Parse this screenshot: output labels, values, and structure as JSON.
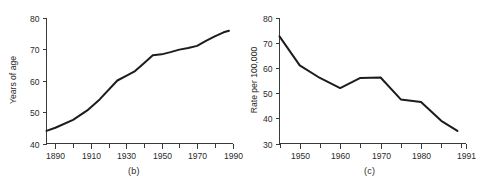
{
  "figure": {
    "panels": [
      {
        "caption": "(b)",
        "ylabel": "Years of age",
        "y_ticks": [
          "40",
          "50",
          "60",
          "70",
          "80"
        ],
        "x_ticks": [
          "1890",
          "1910",
          "1930",
          "1950",
          "1970",
          "1990"
        ]
      },
      {
        "caption": "(c)",
        "ylabel": "Rate per 100,000",
        "y_ticks": [
          "30",
          "40",
          "50",
          "60",
          "70",
          "80"
        ],
        "x_ticks": [
          "1950",
          "1960",
          "1970",
          "1980",
          "1991"
        ]
      }
    ]
  },
  "chart_data": [
    {
      "type": "line",
      "title": "(b)",
      "xlabel": "",
      "ylabel": "Years of age",
      "xlim": [
        1885,
        1990
      ],
      "ylim": [
        40,
        80
      ],
      "xticks": [
        1890,
        1910,
        1930,
        1950,
        1970,
        1990
      ],
      "xticklabels": [
        "1890",
        "1910",
        "1930",
        "1950",
        "1970",
        "1990"
      ],
      "yticks": [
        40,
        50,
        60,
        70,
        80
      ],
      "yticklabels": [
        "40",
        "50",
        "60",
        "70",
        "80"
      ],
      "minor_xtick_interval": 10,
      "grid": false,
      "legend": null,
      "x": [
        1885,
        1890,
        1900,
        1908,
        1915,
        1925,
        1930,
        1935,
        1940,
        1945,
        1950,
        1955,
        1960,
        1965,
        1970,
        1975,
        1980,
        1985,
        1988
      ],
      "values": [
        44.0,
        45.0,
        47.5,
        50.5,
        54.0,
        60.0,
        61.5,
        63.0,
        65.5,
        68.0,
        68.3,
        69.0,
        69.8,
        70.3,
        71.0,
        72.6,
        74.0,
        75.3,
        75.8
      ],
      "series": [
        {
          "name": "Life expectancy",
          "values": [
            44.0,
            45.0,
            47.5,
            50.5,
            54.0,
            60.0,
            61.5,
            63.0,
            65.5,
            68.0,
            68.3,
            69.0,
            69.8,
            70.3,
            71.0,
            72.6,
            74.0,
            75.3,
            75.8
          ]
        }
      ]
    },
    {
      "type": "line",
      "title": "(c)",
      "xlabel": "",
      "ylabel": "Rate per 100,000",
      "xlim": [
        1945,
        1991
      ],
      "ylim": [
        30,
        80
      ],
      "xticks": [
        1950,
        1960,
        1970,
        1980,
        1991
      ],
      "xticklabels": [
        "1950",
        "1960",
        "1970",
        "1980",
        "1991"
      ],
      "yticks": [
        30,
        40,
        50,
        60,
        70,
        80
      ],
      "yticklabels": [
        "30",
        "40",
        "50",
        "60",
        "70",
        "80"
      ],
      "minor_xtick_interval": 5,
      "grid": false,
      "legend": null,
      "x": [
        1945,
        1950,
        1955,
        1960,
        1965,
        1970,
        1975,
        1980,
        1985,
        1989
      ],
      "values": [
        72.5,
        61.0,
        56.0,
        52.0,
        56.0,
        56.2,
        47.5,
        46.5,
        39.0,
        35.0
      ],
      "series": [
        {
          "name": "Rate per 100,000",
          "values": [
            72.5,
            61.0,
            56.0,
            52.0,
            56.0,
            56.2,
            47.5,
            46.5,
            39.0,
            35.0
          ]
        }
      ]
    }
  ]
}
